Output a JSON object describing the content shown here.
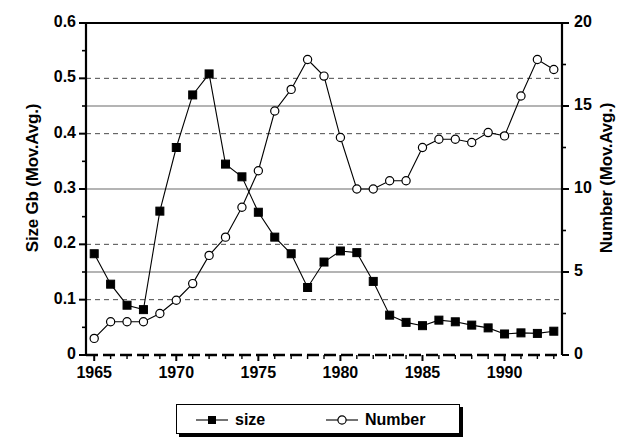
{
  "chart_data": {
    "type": "line",
    "title": "",
    "xlabel": "",
    "ylabel": "Size Gb (Mov.Avg.)",
    "ylabel_right": "Number (Mov.Avg.)",
    "x": [
      1965,
      1966,
      1967,
      1968,
      1969,
      1970,
      1971,
      1972,
      1973,
      1974,
      1975,
      1976,
      1977,
      1978,
      1979,
      1980,
      1981,
      1982,
      1983,
      1984,
      1985,
      1986,
      1987,
      1988,
      1989,
      1990,
      1991,
      1992,
      1993
    ],
    "xlim": [
      1964.5,
      1993.5
    ],
    "xticks": [
      1965,
      1970,
      1975,
      1980,
      1985,
      1990
    ],
    "xtick_labels": [
      "1965",
      "1970",
      "1975",
      "1980",
      "1985",
      "1990"
    ],
    "ylim": [
      0,
      0.6
    ],
    "yticks": [
      0,
      0.1,
      0.2,
      0.3,
      0.4,
      0.5,
      0.6
    ],
    "ytick_labels": [
      "0",
      "0.1",
      "0.2",
      "0.3",
      "0.4",
      "0.5",
      "0.6"
    ],
    "y_minor_ticks": [
      0.05,
      0.15,
      0.25,
      0.35,
      0.45,
      0.55
    ],
    "ylim_right": [
      0,
      20
    ],
    "yticks_right": [
      0,
      5,
      10,
      15,
      20
    ],
    "ytick_labels_right": [
      "0",
      "5",
      "10",
      "15",
      "20"
    ],
    "gridlines_dashed": [
      0.1,
      0.2,
      0.4,
      0.5
    ],
    "gridlines_solid": [
      0.15,
      0.3,
      0.45
    ],
    "grid": true,
    "legend_position": "bottom-center",
    "series": [
      {
        "name": "size",
        "axis": "left",
        "marker": "filled-square",
        "color": "#000000",
        "values": [
          0.183,
          0.128,
          0.09,
          0.082,
          0.26,
          0.375,
          0.47,
          0.508,
          0.345,
          0.322,
          0.258,
          0.213,
          0.183,
          0.122,
          0.168,
          0.188,
          0.185,
          0.133,
          0.072,
          0.059,
          0.053,
          0.063,
          0.06,
          0.054,
          0.049,
          0.038,
          0.04,
          0.039,
          0.043
        ]
      },
      {
        "name": "Number",
        "axis": "right",
        "marker": "open-circle",
        "color": "#000000",
        "values": [
          1.0,
          2.0,
          2.0,
          2.0,
          2.5,
          3.3,
          4.3,
          6.0,
          7.1,
          8.9,
          11.1,
          14.7,
          16.0,
          17.8,
          16.8,
          13.1,
          10.0,
          10.0,
          10.5,
          10.5,
          12.5,
          13.0,
          13.0,
          12.8,
          13.4,
          13.2,
          15.6,
          17.8,
          17.2
        ]
      }
    ],
    "legend": [
      {
        "label": "size",
        "marker": "filled-square"
      },
      {
        "label": "Number",
        "marker": "open-circle"
      }
    ]
  }
}
